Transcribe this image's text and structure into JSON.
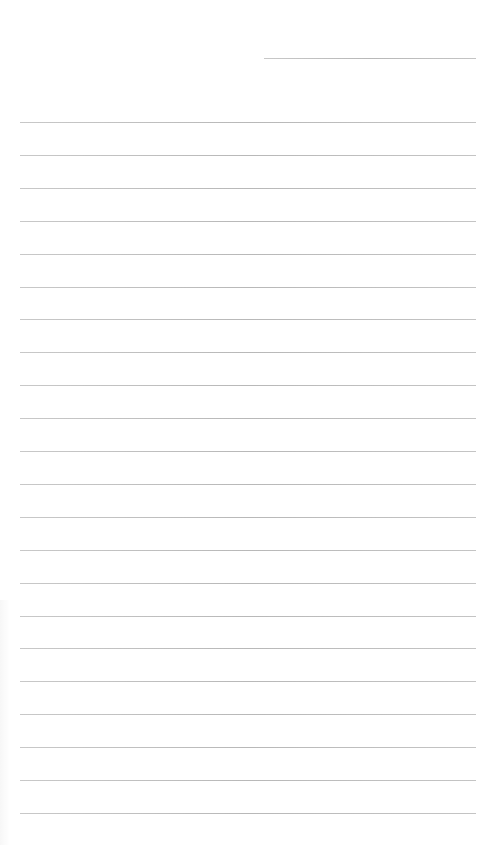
{
  "document": {
    "type": "lined-paper",
    "background_color": "#ffffff",
    "line_color": "#bdbdbd",
    "header_line": {
      "x": 264,
      "y": 58,
      "width": 212
    },
    "ruled_lines": {
      "count": 22,
      "x": 20,
      "width": 456,
      "first_y": 122,
      "spacing": 32.9
    },
    "text": []
  }
}
